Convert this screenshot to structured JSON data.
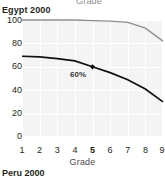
{
  "above_caption": "Grade",
  "below_title": "Peru 2000",
  "panel": {
    "title": "Egypt 2000"
  },
  "colors": {
    "plot_background": "#f4f4f4",
    "gridline": "#ffffff",
    "series_upper": "#8f8f8f",
    "series_lower": "#111111",
    "text": "#231f20"
  },
  "chart_data": {
    "type": "line",
    "title": "Egypt 2000",
    "xlabel": "Grade",
    "ylabel": "",
    "x": [
      1,
      2,
      3,
      4,
      5,
      6,
      7,
      8,
      9
    ],
    "xtick_labels": [
      "1",
      "2",
      "3",
      "4",
      "5",
      "6",
      "7",
      "8",
      "9"
    ],
    "xtick_emphasis": "5",
    "ytick_labels": [
      "0",
      "20",
      "40",
      "60",
      "80",
      "100"
    ],
    "yticks": [
      0,
      20,
      40,
      60,
      80,
      100
    ],
    "ylim": [
      0,
      100
    ],
    "xlim": [
      1,
      9
    ],
    "grid": true,
    "legend": "none",
    "series": [
      {
        "name": "upper",
        "color": "#8f8f8f",
        "values": [
          100,
          100,
          100,
          100,
          99.5,
          99,
          98,
          93,
          82
        ]
      },
      {
        "name": "lower",
        "color": "#111111",
        "values": [
          69,
          68.5,
          67,
          65,
          60,
          55,
          49,
          41,
          30
        ]
      }
    ],
    "annotations": [
      {
        "text": "60%",
        "x": 5,
        "y": 60,
        "marker": "diamond",
        "series": "lower"
      }
    ]
  }
}
